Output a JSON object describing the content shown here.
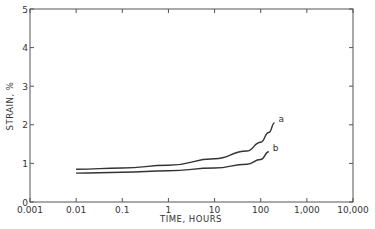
{
  "chart_data": {
    "type": "line",
    "title": "",
    "xlabel": "TIME, HOURS",
    "ylabel": "STRAIN, %",
    "xscale": "log",
    "xlim": [
      0.001,
      10000
    ],
    "ylim": [
      0,
      5
    ],
    "grid": false,
    "legend": "inline curve labels",
    "x_tick_labels": [
      "0.001",
      "0.01",
      "0.1",
      "1",
      "10",
      "100",
      "1,000",
      "10,000"
    ],
    "y_tick_labels": [
      "0",
      "1",
      "2",
      "3",
      "4",
      "5"
    ],
    "series": [
      {
        "name": "a",
        "x": [
          0.01,
          0.1,
          1,
          10,
          50,
          100,
          150,
          200
        ],
        "y": [
          0.85,
          0.88,
          0.95,
          1.12,
          1.32,
          1.55,
          1.8,
          2.05
        ]
      },
      {
        "name": "b",
        "x": [
          0.01,
          0.1,
          1,
          10,
          50,
          100,
          150
        ],
        "y": [
          0.75,
          0.77,
          0.81,
          0.88,
          0.98,
          1.1,
          1.3
        ]
      }
    ]
  },
  "axes": {
    "x_title": "TIME, HOURS",
    "y_title": "STRAIN, %"
  }
}
